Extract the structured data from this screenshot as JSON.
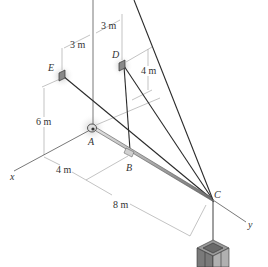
{
  "figure": {
    "type": "3D statics diagram - boom supported by cables with suspended crate",
    "points": {
      "A": "A",
      "B": "B",
      "C": "C",
      "D": "D",
      "E": "E"
    },
    "axes": {
      "x": "x",
      "y": "y"
    },
    "dimensions": {
      "E_offset": "3 m",
      "D_offset": "3 m",
      "D_height": "4 m",
      "E_height": "6 m",
      "AB": "4 m",
      "BC": "8 m"
    },
    "colors": {
      "line": "#333333",
      "dim_line": "#9a9a9a",
      "boom": "#b8b8b8",
      "shadow": "#cccccc"
    }
  }
}
